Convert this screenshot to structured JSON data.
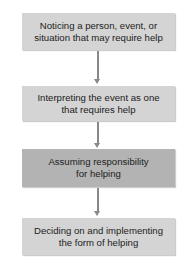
{
  "diagram": {
    "type": "flowchart",
    "steps": [
      {
        "label": "Noticing a person, event, or situation that may require help",
        "line1": "Noticing a person, event, or",
        "line2": "situation that may require help"
      },
      {
        "label": "Interpreting the event as one that requires help",
        "line1": "Interpreting the event as one",
        "line2": "that requires help"
      },
      {
        "label": "Assuming responsibility for helping",
        "line1": "Assuming responsibility",
        "line2": "for helping"
      },
      {
        "label": "Deciding on and implementing the form of helping",
        "line1": "Deciding on and implementing",
        "line2": "the form of helping"
      }
    ],
    "colors": {
      "box_light": "#d4d4d4",
      "box_dark": "#b3b3b3",
      "arrow": "#888888"
    }
  }
}
